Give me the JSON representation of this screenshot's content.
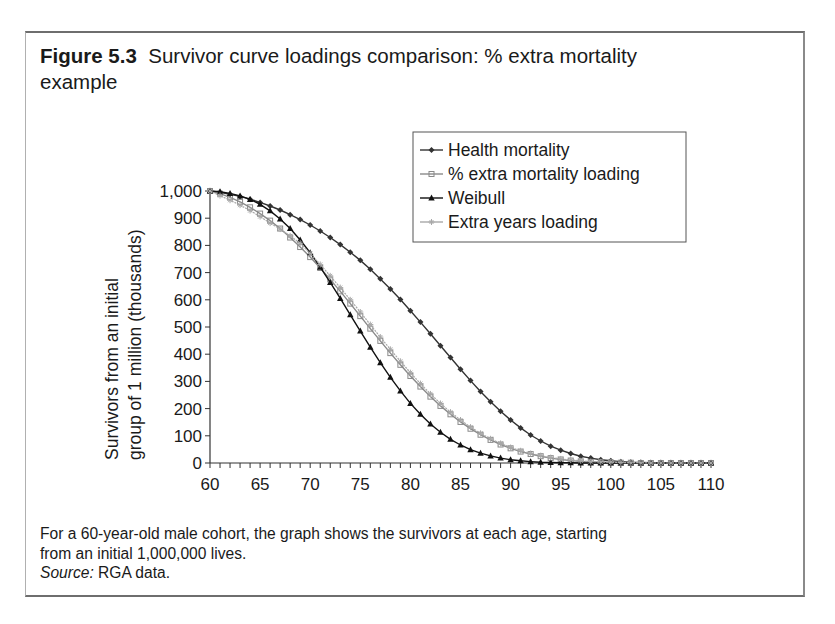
{
  "figure": {
    "number": "Figure 5.3",
    "title": "Survivor curve loadings comparison: % extra mortality example",
    "title_line1": "Survivor curve loadings comparison: % extra mortality",
    "title_line2": "example"
  },
  "caption": {
    "line1": "For a 60-year-old male cohort, the graph shows the survivors at each age, starting",
    "line2": "from an initial 1,000,000 lives.",
    "source_label": "Source:",
    "source_text": " RGA data."
  },
  "colors": {
    "health": "#333333",
    "extra_mortality": "#8a8a8a",
    "weibull": "#111111",
    "extra_years": "#a8a8a8",
    "axis": "#333333",
    "frame": "#6e6e6e"
  },
  "chart_data": {
    "type": "line",
    "title": "Survivor curve loadings comparison: % extra mortality example",
    "xlabel": "",
    "ylabel": "Survivors from an initial group of 1 million (thousands)",
    "ylabel_line1": "Survivors from an initial",
    "ylabel_line2": "group of 1 million (thousands)",
    "xlim": [
      60,
      110
    ],
    "ylim": [
      0,
      1000
    ],
    "x_ticks": [
      60,
      65,
      70,
      75,
      80,
      85,
      90,
      95,
      100,
      105,
      110
    ],
    "y_ticks": [
      0,
      100,
      200,
      300,
      400,
      500,
      600,
      700,
      800,
      900,
      1000
    ],
    "y_tick_labels": [
      "0",
      "100",
      "200",
      "300",
      "400",
      "500",
      "600",
      "700",
      "800",
      "900",
      "1,000"
    ],
    "grid": false,
    "legend_position": "upper right",
    "x": [
      60,
      61,
      62,
      63,
      64,
      65,
      66,
      67,
      68,
      69,
      70,
      71,
      72,
      73,
      74,
      75,
      76,
      77,
      78,
      79,
      80,
      81,
      82,
      83,
      84,
      85,
      86,
      87,
      88,
      89,
      90,
      91,
      92,
      93,
      94,
      95,
      96,
      97,
      98,
      99,
      100,
      101,
      102,
      103,
      104,
      105,
      106,
      107,
      108,
      109,
      110
    ],
    "series": [
      {
        "name": "Health mortality",
        "marker": "diamond",
        "values": [
          1000,
          995,
          988,
          980,
          970,
          958,
          945,
          930,
          913,
          895,
          875,
          853,
          829,
          803,
          775,
          745,
          712,
          677,
          640,
          601,
          560,
          518,
          475,
          431,
          388,
          345,
          303,
          263,
          225,
          190,
          158,
          129,
          103,
          81,
          62,
          47,
          35,
          25,
          18,
          12,
          8,
          5,
          3,
          2,
          1,
          1,
          0,
          0,
          0,
          0,
          0
        ]
      },
      {
        "name": "% extra mortality loading",
        "marker": "square",
        "values": [
          1000,
          990,
          977,
          960,
          940,
          917,
          891,
          862,
          829,
          794,
          757,
          717,
          675,
          631,
          586,
          540,
          494,
          449,
          404,
          361,
          320,
          281,
          244,
          210,
          179,
          151,
          126,
          104,
          85,
          68,
          54,
          42,
          33,
          25,
          18,
          13,
          9,
          6,
          4,
          3,
          2,
          1,
          1,
          0,
          0,
          0,
          0,
          0,
          0,
          0,
          0
        ]
      },
      {
        "name": "Weibull",
        "marker": "triangle",
        "values": [
          1000,
          997,
          991,
          982,
          969,
          951,
          927,
          897,
          862,
          820,
          773,
          720,
          664,
          605,
          545,
          485,
          426,
          369,
          315,
          265,
          219,
          179,
          143,
          113,
          87,
          66,
          49,
          36,
          26,
          18,
          12,
          8,
          5,
          3,
          2,
          1,
          1,
          0,
          0,
          0,
          0,
          0,
          0,
          0,
          0,
          0,
          0,
          0,
          0,
          0,
          0
        ]
      },
      {
        "name": "Extra years loading",
        "marker": "star",
        "values": [
          1000,
          983,
          966,
          948,
          928,
          906,
          882,
          860,
          835,
          808,
          770,
          730,
          688,
          645,
          600,
          555,
          509,
          463,
          418,
          374,
          332,
          292,
          254,
          219,
          187,
          158,
          132,
          109,
          89,
          72,
          57,
          45,
          35,
          27,
          20,
          15,
          11,
          8,
          5,
          4,
          3,
          2,
          1,
          1,
          0,
          0,
          0,
          0,
          0,
          0,
          0
        ]
      }
    ]
  },
  "legend": {
    "items": [
      "Health mortality",
      "% extra mortality loading",
      "Weibull",
      "Extra years loading"
    ]
  }
}
